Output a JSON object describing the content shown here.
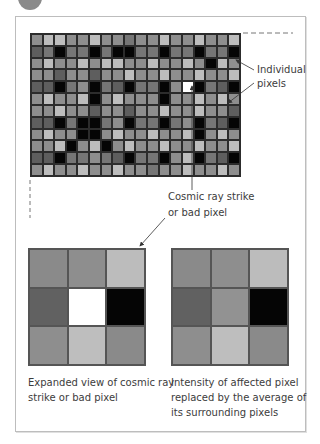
{
  "figure": {
    "badge": "",
    "labels": {
      "individual_pixels_line1": "Individual",
      "individual_pixels_line2": "pixels",
      "cosmic_ray_line1": "Cosmic ray strike",
      "cosmic_ray_line2": "or bad pixel"
    },
    "captions": {
      "before_line1": "Expanded view of cosmic ray",
      "before_line2": "strike or bad pixel",
      "after_line1": "Intensity of affected pixel",
      "after_line2": "replaced by the average of",
      "after_line3": "its surrounding pixels"
    },
    "palette": {
      "K": "#050505",
      "D": "#5e5e5e",
      "d": "#767676",
      "M": "#8e8e8e",
      "L": "#bdbdbd",
      "W": "#ffffff"
    },
    "main_grid": {
      "columns": 18,
      "rows": 12,
      "bad_pixel": {
        "row": 5,
        "col": 14
      },
      "cells": [
        "MLLMMLMMdMMLMMLMML",
        "DdKddKdKKddKddKddK",
        "MLMMLMLLMMLMMLMKLM",
        "MMDMMDMMLMMLMMLMML",
        "DDKdMKdDKddKMWKdDK",
        "MLMMLKMLMMMKMMLMLM",
        "MMLMMDMMDMMLMMLMMD",
        "DDKdKKdMKddKdMKdDK",
        "MLMMKKMLMMLMMLKMLM",
        "MMLKMLKMLMMLMMLMML",
        "DDKddMdDKddKMLKdDK",
        "MLMMLMMLMMdMMLMMLM"
      ]
    },
    "expanded_before": {
      "cells": [
        "#8a8a8a",
        "#8e8e8e",
        "#bcbcbc",
        "#616161",
        "#ffffff",
        "#050505",
        "#8e8e8e",
        "#bebebe",
        "#8a8a8a"
      ]
    },
    "expanded_after": {
      "cells": [
        "#8a8a8a",
        "#8e8e8e",
        "#bcbcbc",
        "#616161",
        "#929292",
        "#050505",
        "#8e8e8e",
        "#bebebe",
        "#8a8a8a"
      ]
    }
  }
}
